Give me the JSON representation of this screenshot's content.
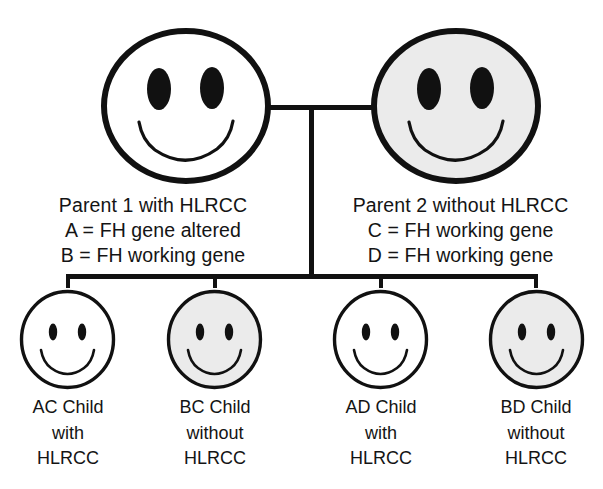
{
  "diagram": {
    "colors": {
      "stroke": "#111111",
      "affected_fill": "#ffffff",
      "unaffected_fill": "#ebebeb",
      "background": "#ffffff",
      "text": "#141414"
    },
    "parents": [
      {
        "id": "parent-1",
        "face_state": "white",
        "title": "Parent 1 with HLRCC",
        "alleles": [
          {
            "symbol": "A",
            "equals": "=",
            "description": "FH gene altered"
          },
          {
            "symbol": "B",
            "equals": "=",
            "description": "FH working gene"
          }
        ]
      },
      {
        "id": "parent-2",
        "face_state": "shaded",
        "title": "Parent 2 without HLRCC",
        "alleles": [
          {
            "symbol": "C",
            "equals": "=",
            "description": "FH working gene"
          },
          {
            "symbol": "D",
            "equals": "=",
            "description": "FH working gene"
          }
        ]
      }
    ],
    "children": [
      {
        "id": "child-ac",
        "face_state": "white",
        "genotype_line": "AC Child",
        "status_line": "with",
        "condition_line": "HLRCC"
      },
      {
        "id": "child-bc",
        "face_state": "shaded",
        "genotype_line": "BC Child",
        "status_line": "without",
        "condition_line": "HLRCC"
      },
      {
        "id": "child-ad",
        "face_state": "white",
        "genotype_line": "AD Child",
        "status_line": "with",
        "condition_line": "HLRCC"
      },
      {
        "id": "child-bd",
        "face_state": "shaded",
        "genotype_line": "BD Child",
        "status_line": "without",
        "condition_line": "HLRCC"
      }
    ]
  }
}
